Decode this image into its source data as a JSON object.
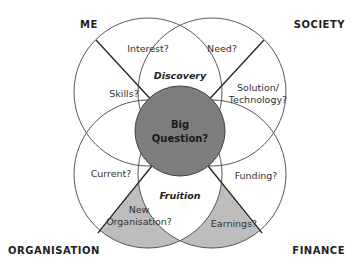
{
  "diagram": {
    "corners": {
      "top_left": "ME",
      "top_right": "SOCIETY",
      "bottom_left": "ORGANISATION",
      "bottom_right": "FINANCE"
    },
    "center": {
      "line1": "Big",
      "line2": "Question?"
    },
    "overlaps": {
      "top": "Discovery",
      "bottom": "Fruition"
    },
    "segments": {
      "me_interest": "Interest?",
      "me_skills": "Skills?",
      "society_need": "Need?",
      "society_solution_line1": "Solution/",
      "society_solution_line2": "Technology?",
      "org_current": "Current?",
      "org_new_line1": "New",
      "org_new_line2": "Organisation?",
      "finance_funding": "Funding?",
      "finance_earnings": "Earnings?"
    },
    "colors": {
      "center_fill": "#7d7d7d",
      "shaded_fill": "#bdbdbd",
      "stroke": "#555555",
      "divider": "#2a2a2a"
    }
  }
}
